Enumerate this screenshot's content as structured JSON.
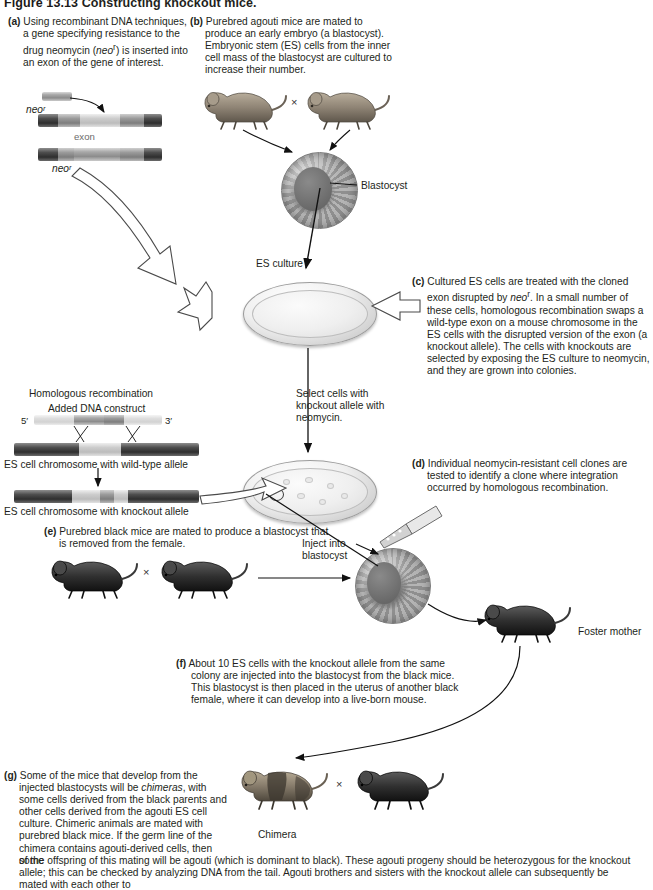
{
  "figure": {
    "number": "Figure 13.13",
    "title": "Constructing knockout mice."
  },
  "panels": {
    "a": {
      "label": "(a)",
      "text": "Using recombinant DNA techniques, a gene specifying resistance to the drug neomycin (neoʳ) is inserted into an exon of the gene of interest."
    },
    "b": {
      "label": "(b)",
      "text": "Purebred agouti mice are mated to produce an early embryo (a blastocyst). Embryonic stem (ES) cells from the inner cell mass of the blastocyst are cultured to increase their number."
    },
    "c": {
      "label": "(c)",
      "text": "Cultured ES cells are treated with the cloned exon disrupted by neoʳ. In a small number of these cells, homologous recombination swaps a wild-type exon on a mouse chromosome in the ES cells with the disrupted version of the exon (a knockout allele). The cells with knockouts are selected by exposing the ES culture to neomycin, and they are grown into colonies."
    },
    "d": {
      "label": "(d)",
      "text": "Individual neomycin-resistant cell clones are tested to identify a clone where integration occurred by homologous recombination."
    },
    "e": {
      "label": "(e)",
      "text": "Purebred black mice are mated to produce a blastocyst that is removed from the female."
    },
    "f": {
      "label": "(f)",
      "text": "About 10 ES cells with the knockout allele from the same colony are injected into the blastocyst from the black mice. This blastocyst is then placed in the uterus of another black female, where it can develop into a live-born mouse."
    },
    "g": {
      "label": "(g)",
      "text_col": "Some of the mice that develop from the injected blastocysts will be chimeras, with some cells derived from the black parents and other cells derived from the agouti ES cell culture. Chimeric animals are mated with purebred black mice. If the germ line of the chimera contains agouti-derived cells, then some",
      "text_full": "of the offspring of this mating will be agouti (which is dominant to black). These agouti progeny should be heterozygous for the knockout allele; this can be checked by analyzing DNA from the tail. Agouti brothers and sisters with the knockout allele can subsequently be mated with each other to"
    }
  },
  "labels": {
    "neo_a": "neoʳ",
    "exon": "exon",
    "neo_b": "neoʳ",
    "blastocyst": "Blastocyst",
    "es_culture": "ES culture",
    "select_cells": "Select cells with knockout allele with neomycin.",
    "homologous_recombination": "Homologous recombination",
    "added_dna_construct": "Added DNA construct",
    "five_prime": "5′",
    "three_prime": "3′",
    "es_wild_type": "ES cell chromosome with wild-type allele",
    "es_knockout": "ES cell chromosome with knockout allele",
    "inject_into_blastocyst": "Inject into blastocyst",
    "foster_mother": "Foster mother",
    "chimera": "Chimera",
    "cross_symbol": "×"
  },
  "colors": {
    "ink": "#231f20",
    "chromosome_dark": "#3a3a3a",
    "chromosome_light": "#d6d6d6",
    "arrow": "#1a1a1a",
    "mouse_agouti": "#8f8475",
    "mouse_black": "#2b2b2b"
  }
}
